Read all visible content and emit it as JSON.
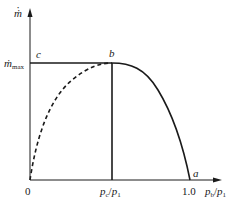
{
  "diagram": {
    "type": "mass-flow-rate vs pressure-ratio curve",
    "y_axis": {
      "label": "ṁ",
      "max_label_base": "ṁ",
      "max_label_sub": "max"
    },
    "x_axis": {
      "origin_label": "0",
      "critical_label_num": "p",
      "critical_label_num_sub": "c",
      "critical_label_den": "p",
      "critical_label_den_sub": "1",
      "end_tick_label": "1.0",
      "axis_label_num": "p",
      "axis_label_num_sub": "b",
      "axis_label_den": "p",
      "axis_label_den_sub": "1",
      "slash": "/"
    },
    "points": {
      "a": "a",
      "b": "b",
      "c": "c"
    },
    "curves": [
      {
        "name": "solid-curve-b-to-a",
        "style": "solid",
        "desc": "actual flow, from b (max) falling to a at ratio 1.0"
      },
      {
        "name": "dashed-curve-0-to-b",
        "style": "dashed",
        "desc": "theoretical curve from origin rising to b"
      },
      {
        "name": "horizontal-line-c-b",
        "style": "solid",
        "desc": "choked flow at ṁmax"
      },
      {
        "name": "vertical-line-b",
        "style": "solid",
        "desc": "critical pressure ratio marker"
      }
    ],
    "colors": {
      "line": "#1a1a1a",
      "background": "#ffffff"
    }
  }
}
